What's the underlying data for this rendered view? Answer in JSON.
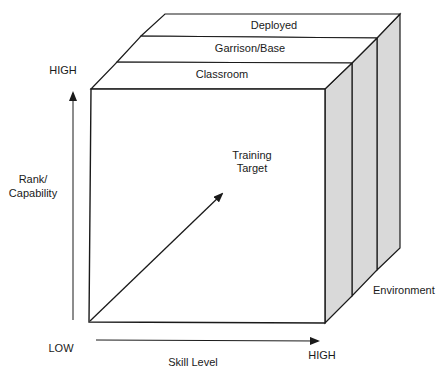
{
  "diagram": {
    "layers": [
      {
        "label": "Deployed"
      },
      {
        "label": "Garrison/Base"
      },
      {
        "label": "Classroom"
      }
    ],
    "center_label": {
      "line1": "Training",
      "line2": "Target"
    },
    "y_axis": {
      "high": "HIGH",
      "low": "LOW",
      "label_line1": "Rank/",
      "label_line2": "Capability"
    },
    "x_axis": {
      "high": "HIGH",
      "label": "Skill Level"
    },
    "z_axis": {
      "label": "Environment"
    },
    "colors": {
      "line": "#1a1a1a",
      "side_fill": "#d9d9d9",
      "face_fill": "#ffffff"
    }
  }
}
